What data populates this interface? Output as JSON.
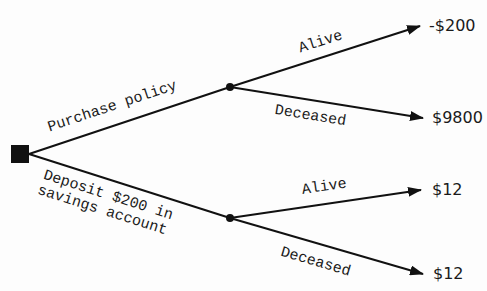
{
  "diagram": {
    "type": "decision-tree",
    "decision_node": {
      "shape": "square"
    },
    "choices": [
      {
        "label": "Purchase policy",
        "outcomes": [
          {
            "label": "Alive",
            "payoff": "-$200"
          },
          {
            "label": "Deceased",
            "payoff": "$9800"
          }
        ]
      },
      {
        "label_line1": "Deposit $200 in",
        "label_line2": "savings account",
        "outcomes": [
          {
            "label": "Alive",
            "payoff": "$12"
          },
          {
            "label": "Deceased",
            "payoff": "$12"
          }
        ]
      }
    ],
    "colors": {
      "line": "#111111",
      "text": "#1a1a1a",
      "background": "#fdfdfd"
    }
  }
}
